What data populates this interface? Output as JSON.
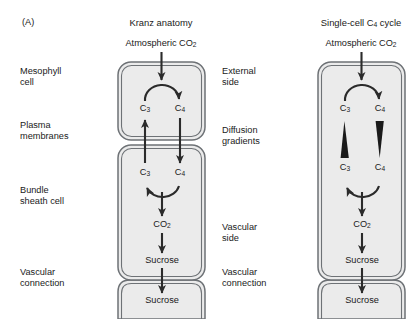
{
  "figure": {
    "panel_letter": "(A)",
    "background_color": "#ffffff",
    "cell_fill_color": "#ebebeb",
    "membrane_color": "#6e7276",
    "arrow_color": "#2b2b2b"
  },
  "panels": [
    {
      "id": "kranz",
      "title": "Kranz anatomy",
      "input_label": "Atmospheric CO",
      "input_sub": "2",
      "side_labels": [
        {
          "line1": "Mesophyll",
          "line2": "cell"
        },
        {
          "line1": "Plasma",
          "line2": "membranes"
        },
        {
          "line1": "Bundle",
          "line2": "sheath cell"
        },
        {
          "line1": "Vascular",
          "line2": "connection"
        }
      ],
      "compartments": [
        {
          "name": "mesophyll-cell",
          "nodes": [
            "C3",
            "C4"
          ]
        },
        {
          "name": "bundle-sheath-cell",
          "nodes": [
            "C3",
            "C4",
            "CO2",
            "Sucrose"
          ]
        },
        {
          "name": "vascular-connection",
          "nodes": [
            "Sucrose"
          ]
        }
      ],
      "nodes": [
        {
          "id": "meso-c3",
          "base": "C",
          "sub": "3"
        },
        {
          "id": "meso-c4",
          "base": "C",
          "sub": "4"
        },
        {
          "id": "bs-c3",
          "base": "C",
          "sub": "3"
        },
        {
          "id": "bs-c4",
          "base": "C",
          "sub": "4"
        },
        {
          "id": "bs-co2",
          "base": "CO",
          "sub": "2"
        },
        {
          "id": "bs-sucrose",
          "base": "Sucrose",
          "sub": ""
        },
        {
          "id": "vasc-sucrose",
          "base": "Sucrose",
          "sub": ""
        }
      ]
    },
    {
      "id": "single-cell",
      "title_part1": "Single-cell C",
      "title_sub": "4",
      "title_part2": " cycle",
      "input_label": "Atmospheric CO",
      "input_sub": "2",
      "side_labels": [
        {
          "line1": "External",
          "line2": "side"
        },
        {
          "line1": "Diffusion",
          "line2": "gradients"
        },
        {
          "line1": "Vascular",
          "line2": "side"
        },
        {
          "line1": "Vascular",
          "line2": "connection"
        }
      ],
      "compartments": [
        {
          "name": "single-cell",
          "nodes": [
            "C3",
            "C4",
            "C3",
            "C4",
            "CO2",
            "Sucrose"
          ]
        },
        {
          "name": "vascular-connection",
          "nodes": [
            "Sucrose"
          ]
        }
      ],
      "nodes": [
        {
          "id": "top-c3",
          "base": "C",
          "sub": "3"
        },
        {
          "id": "top-c4",
          "base": "C",
          "sub": "4"
        },
        {
          "id": "bot-c3",
          "base": "C",
          "sub": "3"
        },
        {
          "id": "bot-c4",
          "base": "C",
          "sub": "4"
        },
        {
          "id": "co2",
          "base": "CO",
          "sub": "2"
        },
        {
          "id": "sucrose",
          "base": "Sucrose",
          "sub": ""
        },
        {
          "id": "vasc-sucrose",
          "base": "Sucrose",
          "sub": ""
        }
      ],
      "gradient_shapes": [
        {
          "id": "c3-gradient",
          "direction": "widens-downward"
        },
        {
          "id": "c4-gradient",
          "direction": "narrows-downward"
        }
      ]
    }
  ]
}
